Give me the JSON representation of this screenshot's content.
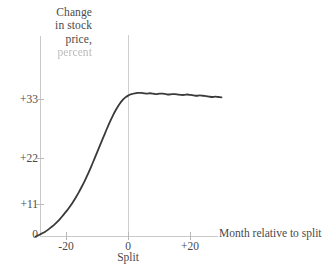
{
  "chart_data": {
    "type": "line",
    "title": "Change in stock price, percent",
    "title_lines": [
      "Change",
      "in stock",
      "price,",
      "percent"
    ],
    "xlabel": "Month relative to split",
    "ylabel": "Change in stock price, percent",
    "xlim": [
      -30,
      30
    ],
    "ylim": [
      0,
      44
    ],
    "grid": false,
    "legend": null,
    "xticks": [
      -20,
      0,
      20
    ],
    "xtick_labels": [
      "-20",
      "0",
      "+20"
    ],
    "yticks": [
      0,
      11,
      22,
      33
    ],
    "ytick_labels": [
      "0",
      "+11",
      "+22",
      "+33"
    ],
    "annotations": [
      {
        "name": "split-caption",
        "text": "Split",
        "x": 0,
        "y": 0
      }
    ],
    "reference_lines": [
      {
        "name": "split-line",
        "orientation": "vertical",
        "x": 0
      }
    ],
    "series": [
      {
        "name": "Cumulative average residual",
        "color": "#3a3a3a",
        "x": [
          -30,
          -29,
          -28,
          -27,
          -26,
          -25,
          -24,
          -23,
          -22,
          -21,
          -20,
          -19,
          -18,
          -17,
          -16,
          -15,
          -14,
          -13,
          -12,
          -11,
          -10,
          -9,
          -8,
          -7,
          -6,
          -5,
          -4,
          -3,
          -2,
          -1,
          0,
          1,
          2,
          3,
          4,
          5,
          6,
          7,
          8,
          9,
          10,
          11,
          12,
          13,
          14,
          15,
          16,
          17,
          18,
          19,
          20,
          21,
          22,
          23,
          24,
          25,
          26,
          27,
          28,
          29,
          30
        ],
        "values": [
          0.0,
          0.3,
          0.7,
          1.1,
          1.6,
          2.2,
          2.8,
          3.5,
          4.3,
          5.2,
          6.1,
          7.1,
          8.2,
          9.4,
          10.7,
          12.1,
          13.6,
          15.2,
          16.9,
          18.7,
          20.5,
          22.3,
          24.1,
          25.9,
          27.6,
          29.2,
          30.6,
          31.8,
          32.8,
          33.5,
          34.0,
          34.3,
          34.5,
          34.6,
          34.6,
          34.5,
          34.4,
          34.5,
          34.4,
          34.3,
          34.4,
          34.4,
          34.3,
          34.2,
          34.3,
          34.3,
          34.2,
          34.1,
          34.1,
          34.2,
          34.1,
          34.0,
          33.9,
          34.0,
          33.9,
          33.8,
          33.7,
          33.6,
          33.7,
          33.6,
          33.5
        ]
      }
    ]
  }
}
